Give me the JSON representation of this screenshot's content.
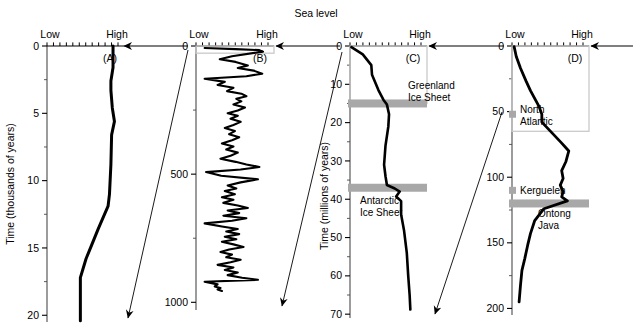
{
  "figure": {
    "title": "Sea level",
    "background": "#ffffff",
    "curve_color": "#000000",
    "band_color": "#a8a8a8",
    "box_color": "#c9c9c9"
  },
  "axis_labels": {
    "low": "Low",
    "high": "High"
  },
  "panels": [
    {
      "id": "A",
      "tag": "(A)",
      "ylabel": "Time (thousands of years)",
      "yticks": [
        "0",
        "5",
        "10",
        "15",
        "20"
      ],
      "ytick_values": [
        0,
        5,
        10,
        15,
        20
      ],
      "ylim": [
        0,
        20.5
      ],
      "xlabel_low": "Low",
      "xlabel_high": "High",
      "annotations": [],
      "bands": []
    },
    {
      "id": "B",
      "tag": "(B)",
      "ylabel": "",
      "yticks": [
        "0",
        "500",
        "1000"
      ],
      "ytick_values": [
        0,
        500,
        1000
      ],
      "ylim": [
        0,
        1030
      ],
      "xlabel_low": "Low",
      "xlabel_high": "High",
      "annotations": [],
      "bands": []
    },
    {
      "id": "C",
      "tag": "(C)",
      "ylabel": "Time (millions of years)",
      "yticks": [
        "0",
        "10",
        "20",
        "30",
        "40",
        "50",
        "60",
        "70"
      ],
      "ytick_values": [
        0,
        10,
        20,
        30,
        40,
        50,
        60,
        70
      ],
      "ylim": [
        0,
        71
      ],
      "xlabel_low": "Low",
      "xlabel_high": "High",
      "annotations": [
        {
          "text_line1": "Greenland",
          "text_line2": "Ice Sheet",
          "at_time": 15
        },
        {
          "text_line1": "Antarctic",
          "text_line2": "Ice Sheet",
          "at_time": 37
        }
      ],
      "bands": [
        {
          "name": "greenland-ice-sheet-band",
          "at_time": 15
        },
        {
          "name": "antarctic-ice-sheet-band",
          "at_time": 37
        }
      ]
    },
    {
      "id": "D",
      "tag": "(D)",
      "ylabel": "",
      "yticks": [
        "0",
        "50",
        "100",
        "150",
        "200"
      ],
      "ytick_values": [
        0,
        50,
        100,
        150,
        200
      ],
      "ylim": [
        0,
        205
      ],
      "xlabel_low": "Low",
      "xlabel_high": "High",
      "annotations": [
        {
          "text_line1": "North",
          "text_line2": "Atlantic",
          "at_time": 52
        },
        {
          "text_line1": "Kerguelen",
          "text_line2": "",
          "at_time": 110
        },
        {
          "text_line1": "Ontong",
          "text_line2": "Java",
          "at_time": 120
        }
      ],
      "bands": [
        {
          "name": "north-atlantic-marker",
          "at_time": 52
        },
        {
          "name": "kerguelen-marker",
          "at_time": 110
        },
        {
          "name": "ontong-java-band",
          "at_time": 120
        }
      ]
    }
  ],
  "chart_data": {
    "type": "line",
    "title": "Sea level",
    "xlabel": "Sea level (Low to High)",
    "ylabel": "Time",
    "series": [
      {
        "name": "A",
        "panel": "A",
        "ylabel": "Time (thousands of years)",
        "ylim": [
          0,
          20.5
        ],
        "xlim": [
          0,
          1
        ],
        "points": [
          [
            0.93,
            0.0
          ],
          [
            0.93,
            1.6
          ],
          [
            0.9,
            2.6
          ],
          [
            0.9,
            3.3
          ],
          [
            0.92,
            4.6
          ],
          [
            0.95,
            5.6
          ],
          [
            0.91,
            6.6
          ],
          [
            0.9,
            8.8
          ],
          [
            0.88,
            11.0
          ],
          [
            0.86,
            11.9
          ],
          [
            0.72,
            13.6
          ],
          [
            0.62,
            14.9
          ],
          [
            0.55,
            15.8
          ],
          [
            0.47,
            17.2
          ],
          [
            0.47,
            20.4
          ]
        ]
      },
      {
        "name": "B",
        "panel": "B",
        "ylabel": "Time (thousands of years)",
        "ylim": [
          0,
          1030
        ],
        "xlim": [
          0,
          1
        ],
        "points": [
          [
            0.12,
            8
          ],
          [
            0.55,
            12
          ],
          [
            0.88,
            16
          ],
          [
            0.93,
            22
          ],
          [
            0.5,
            40
          ],
          [
            0.33,
            52
          ],
          [
            0.55,
            62
          ],
          [
            0.72,
            76
          ],
          [
            0.58,
            86
          ],
          [
            0.8,
            96
          ],
          [
            0.92,
            108
          ],
          [
            0.7,
            118
          ],
          [
            0.12,
            128
          ],
          [
            0.4,
            140
          ],
          [
            0.3,
            152
          ],
          [
            0.52,
            163
          ],
          [
            0.43,
            176
          ],
          [
            0.63,
            186
          ],
          [
            0.7,
            196
          ],
          [
            0.56,
            206
          ],
          [
            0.63,
            216
          ],
          [
            0.52,
            228
          ],
          [
            0.68,
            240
          ],
          [
            0.58,
            252
          ],
          [
            0.44,
            262
          ],
          [
            0.58,
            272
          ],
          [
            0.48,
            284
          ],
          [
            0.62,
            296
          ],
          [
            0.52,
            308
          ],
          [
            0.4,
            320
          ],
          [
            0.54,
            332
          ],
          [
            0.46,
            344
          ],
          [
            0.6,
            356
          ],
          [
            0.5,
            368
          ],
          [
            0.36,
            380
          ],
          [
            0.52,
            392
          ],
          [
            0.42,
            404
          ],
          [
            0.58,
            416
          ],
          [
            0.48,
            428
          ],
          [
            0.34,
            440
          ],
          [
            0.55,
            452
          ],
          [
            0.7,
            462
          ],
          [
            0.88,
            472
          ],
          [
            0.62,
            482
          ],
          [
            0.14,
            492
          ],
          [
            0.35,
            506
          ],
          [
            0.86,
            520
          ],
          [
            0.62,
            532
          ],
          [
            0.44,
            544
          ],
          [
            0.56,
            556
          ],
          [
            0.4,
            566
          ],
          [
            0.54,
            578
          ],
          [
            0.36,
            590
          ],
          [
            0.52,
            600
          ],
          [
            0.38,
            612
          ],
          [
            0.58,
            622
          ],
          [
            0.72,
            632
          ],
          [
            0.44,
            642
          ],
          [
            0.6,
            652
          ],
          [
            0.38,
            662
          ],
          [
            0.7,
            672
          ],
          [
            0.5,
            682
          ],
          [
            0.12,
            692
          ],
          [
            0.36,
            704
          ],
          [
            0.58,
            714
          ],
          [
            0.42,
            724
          ],
          [
            0.6,
            734
          ],
          [
            0.4,
            744
          ],
          [
            0.56,
            754
          ],
          [
            0.36,
            764
          ],
          [
            0.52,
            774
          ],
          [
            0.66,
            784
          ],
          [
            0.46,
            794
          ],
          [
            0.34,
            804
          ],
          [
            0.5,
            814
          ],
          [
            0.42,
            824
          ],
          [
            0.62,
            834
          ],
          [
            0.48,
            844
          ],
          [
            0.3,
            854
          ],
          [
            0.52,
            864
          ],
          [
            0.4,
            874
          ],
          [
            0.58,
            884
          ],
          [
            0.44,
            894
          ],
          [
            0.64,
            904
          ],
          [
            0.86,
            912
          ],
          [
            0.12,
            920
          ],
          [
            0.3,
            930
          ],
          [
            0.26,
            938
          ],
          [
            0.34,
            944
          ],
          [
            0.3,
            950
          ],
          [
            0.36,
            956
          ]
        ]
      },
      {
        "name": "C",
        "panel": "C",
        "ylabel": "Time (millions of years)",
        "ylim": [
          0,
          71
        ],
        "xlim": [
          0,
          1
        ],
        "points": [
          [
            0.02,
            0.3
          ],
          [
            0.18,
            2.2
          ],
          [
            0.3,
            5.0
          ],
          [
            0.31,
            7.5
          ],
          [
            0.4,
            11.5
          ],
          [
            0.47,
            14.0
          ],
          [
            0.52,
            15.3
          ],
          [
            0.55,
            17.8
          ],
          [
            0.54,
            21.0
          ],
          [
            0.5,
            26.0
          ],
          [
            0.48,
            31.0
          ],
          [
            0.5,
            34.0
          ],
          [
            0.52,
            36.3
          ],
          [
            0.63,
            37.2
          ],
          [
            0.7,
            38.0
          ],
          [
            0.65,
            39.3
          ],
          [
            0.72,
            40.5
          ],
          [
            0.72,
            44.0
          ],
          [
            0.76,
            48.0
          ],
          [
            0.8,
            54.0
          ],
          [
            0.82,
            60.0
          ],
          [
            0.84,
            65.0
          ],
          [
            0.85,
            68.8
          ]
        ]
      },
      {
        "name": "D",
        "panel": "D",
        "ylabel": "Time (millions of years)",
        "ylim": [
          0,
          205
        ],
        "xlim": [
          0,
          1
        ],
        "points": [
          [
            0.03,
            0.5
          ],
          [
            0.06,
            8
          ],
          [
            0.12,
            17
          ],
          [
            0.2,
            27
          ],
          [
            0.26,
            34
          ],
          [
            0.38,
            46
          ],
          [
            0.42,
            52
          ],
          [
            0.42,
            58
          ],
          [
            0.56,
            66
          ],
          [
            0.7,
            74
          ],
          [
            0.8,
            80
          ],
          [
            0.76,
            88
          ],
          [
            0.7,
            95
          ],
          [
            0.72,
            101
          ],
          [
            0.68,
            106
          ],
          [
            0.72,
            111
          ],
          [
            0.7,
            115
          ],
          [
            0.78,
            118
          ],
          [
            0.45,
            124
          ],
          [
            0.32,
            133
          ],
          [
            0.26,
            143
          ],
          [
            0.22,
            152
          ],
          [
            0.18,
            162
          ],
          [
            0.14,
            171
          ],
          [
            0.12,
            182
          ],
          [
            0.1,
            195
          ]
        ]
      }
    ]
  }
}
